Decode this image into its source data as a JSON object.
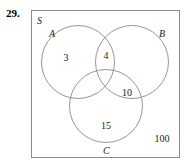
{
  "problem": {
    "number": "29."
  },
  "diagram": {
    "type": "venn-3-set",
    "universal_set_label": "S",
    "sets": [
      {
        "id": "A",
        "label": "A"
      },
      {
        "id": "B",
        "label": "B"
      },
      {
        "id": "C",
        "label": "C"
      }
    ],
    "regions": [
      {
        "id": "A-only",
        "label": "A only",
        "value": "3"
      },
      {
        "id": "A-and-B",
        "label": "A and B only",
        "value": "4"
      },
      {
        "id": "B-and-C",
        "label": "B and C only",
        "value": "10"
      },
      {
        "id": "C-only",
        "label": "C only",
        "value": "15"
      },
      {
        "id": "outside",
        "label": "outside all sets",
        "value": "100"
      }
    ],
    "colors": {
      "stroke": "#8a8a8a",
      "box_border": "#8a8a8a",
      "text": "#1a1a1a",
      "background": "#ffffff"
    }
  }
}
